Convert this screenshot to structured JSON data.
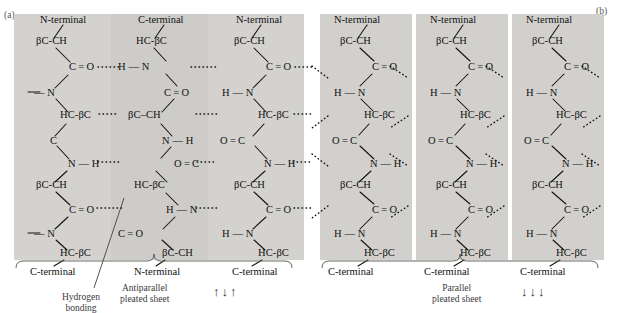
{
  "figure": {
    "panel_a_letter": "(a)",
    "panel_b_letter": "(b)"
  },
  "captions": {
    "antiparallel_line1": "Antiparallel",
    "antiparallel_line2": "pleated sheet",
    "antiparallel_arrows": "↑↓↑",
    "parallel_line1": "Parallel",
    "parallel_line2": "pleated sheet",
    "parallel_arrows": "↓↓↓",
    "hydrogen_line1": "Hydrogen",
    "hydrogen_line2": "bonding"
  },
  "panel_a": {
    "name": "antiparallel-pleated-sheet",
    "columns": [
      {
        "top_terminal": "N-terminal",
        "bottom_terminal": "C-terminal",
        "atoms": [
          "βC-CH",
          "C = O",
          "— N",
          "HC-βC",
          "C",
          "N — H",
          "βC-CH",
          "C = O",
          "— N",
          "HC-βC"
        ]
      },
      {
        "top_terminal": "C-terminal",
        "bottom_terminal": "N-terminal",
        "atoms": [
          "HC-βC",
          "H — N",
          "C = O",
          "βC–CH",
          "N — H",
          "O = C",
          "HC-βC",
          "H — N",
          "C = O",
          "βC-CH"
        ]
      },
      {
        "top_terminal": "N-terminal",
        "bottom_terminal": "C-terminal",
        "atoms": [
          "βC-CH",
          "C = O",
          "H — N",
          "HC-βC",
          "O = C",
          "N — H",
          "βC-CH",
          "C = O",
          "H — N",
          "HC-βC"
        ]
      }
    ]
  },
  "panel_b": {
    "name": "parallel-pleated-sheet",
    "columns": [
      {
        "top_terminal": "N-terminal",
        "bottom_terminal": "C-terminal",
        "atoms": [
          "βC-CH",
          "C = O",
          "H — N",
          "HC-βC",
          "O = C",
          "N — H",
          "βC-CH",
          "C = O",
          "H — N",
          "HC-βC"
        ]
      },
      {
        "top_terminal": "N-terminal",
        "bottom_terminal": "C-terminal",
        "atoms": [
          "βC-CH",
          "C = O",
          "H — N",
          "HC-βC",
          "O = C",
          "N — H",
          "βC-CH",
          "C = O",
          "H — N",
          "HC-βC"
        ]
      },
      {
        "top_terminal": "N-terminal",
        "bottom_terminal": "C-terminal",
        "atoms": [
          "βC-CH",
          "C = O",
          "H — N",
          "HC-βC",
          "O = C",
          "N — H",
          "βC-CH",
          "C = O",
          "H — N",
          "HC-βC"
        ]
      }
    ]
  },
  "colors": {
    "sheet_background": "#d2d0cd",
    "sheet_background_alt": "#cecccd",
    "bond_stroke": "#111111",
    "page_background": "#ffffff",
    "caption_text": "#3a3a3a"
  }
}
